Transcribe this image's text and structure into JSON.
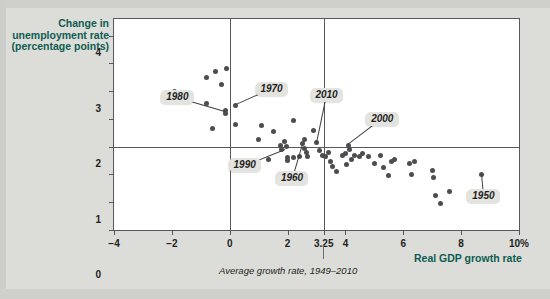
{
  "chart": {
    "type": "scatter",
    "y_axis_title": "Change in unemployment rate (percentage points)",
    "x_axis_title": "Real GDP growth rate",
    "average_caption": "Average growth rate, 1949–2010",
    "x_ticks": [
      "-4",
      "-2",
      "0",
      "2",
      "3.25",
      "4",
      "6",
      "8",
      "10%"
    ],
    "y_ticks": [
      "4",
      "3",
      "2",
      "1",
      "0",
      "-1",
      "-2",
      "-3"
    ],
    "average_growth_rate": "3.25",
    "colors": {
      "axis_title": "#0f5c52",
      "point": "#4d4d4f",
      "callout_bg": "#e3e3e0",
      "plot_bg": "#ffffff",
      "page_bg": "#dcdcd8"
    }
  },
  "chart_data": {
    "type": "scatter",
    "title": "",
    "xlabel": "Real GDP growth rate",
    "ylabel": "Change in unemployment rate (percentage points)",
    "xlim": [
      -4,
      10
    ],
    "ylim": [
      -3,
      4.6
    ],
    "xticks": [
      -4,
      -2,
      0,
      2,
      3.25,
      4,
      6,
      8,
      10
    ],
    "xticklabels": [
      "-4",
      "-2",
      "0",
      "2",
      "3.25",
      "4",
      "6",
      "8",
      "10%"
    ],
    "yticks": [
      4,
      3,
      2,
      1,
      0,
      -1,
      -2,
      -3
    ],
    "yticklabels": [
      "4",
      "3",
      "2",
      "1",
      "0",
      "-1",
      "-2",
      "-3"
    ],
    "grid": false,
    "legend": null,
    "reference_lines": [
      {
        "orientation": "vertical",
        "value": 0,
        "label": ""
      },
      {
        "orientation": "vertical",
        "value": 3.25,
        "label": "Average growth rate, 1949-2010"
      },
      {
        "orientation": "horizontal",
        "value": 0,
        "label": ""
      }
    ],
    "annotations": [
      {
        "label": "1980",
        "x": -0.15,
        "y": 1.3
      },
      {
        "label": "1970",
        "x": 0.2,
        "y": 1.5
      },
      {
        "label": "2010",
        "x": 3.0,
        "y": 0.15
      },
      {
        "label": "2000",
        "x": 4.1,
        "y": 0.05
      },
      {
        "label": "1990",
        "x": 1.9,
        "y": -0.1
      },
      {
        "label": "1960",
        "x": 2.5,
        "y": 0.1
      },
      {
        "label": "1950",
        "x": 8.7,
        "y": -1.0
      }
    ],
    "points": [
      {
        "x": -1.9,
        "y": 2.0
      },
      {
        "x": -0.8,
        "y": 2.5
      },
      {
        "x": -0.5,
        "y": 2.7
      },
      {
        "x": -0.3,
        "y": 2.25
      },
      {
        "x": -0.1,
        "y": 2.8
      },
      {
        "x": -0.8,
        "y": 1.55
      },
      {
        "x": -0.15,
        "y": 1.3
      },
      {
        "x": -0.15,
        "y": 1.2
      },
      {
        "x": -0.6,
        "y": 0.65
      },
      {
        "x": 0.2,
        "y": 1.5
      },
      {
        "x": 0.2,
        "y": 0.8
      },
      {
        "x": 1.1,
        "y": 0.75
      },
      {
        "x": 1.5,
        "y": 0.55
      },
      {
        "x": 1.0,
        "y": 0.25
      },
      {
        "x": 2.2,
        "y": 0.95
      },
      {
        "x": 2.9,
        "y": 0.6
      },
      {
        "x": 2.6,
        "y": 0.25
      },
      {
        "x": 3.0,
        "y": 0.15
      },
      {
        "x": 1.75,
        "y": 0.05
      },
      {
        "x": 1.9,
        "y": 0.2
      },
      {
        "x": 1.95,
        "y": 0.0
      },
      {
        "x": 2.0,
        "y": -0.5
      },
      {
        "x": 1.8,
        "y": -0.1
      },
      {
        "x": 1.35,
        "y": -0.45
      },
      {
        "x": 2.5,
        "y": 0.1
      },
      {
        "x": 2.6,
        "y": -0.05
      },
      {
        "x": 2.65,
        "y": -0.2
      },
      {
        "x": 2.7,
        "y": -0.35
      },
      {
        "x": 2.4,
        "y": -0.35
      },
      {
        "x": 2.2,
        "y": -0.4
      },
      {
        "x": 2.0,
        "y": -0.4
      },
      {
        "x": 3.2,
        "y": -0.3
      },
      {
        "x": 3.3,
        "y": -0.35
      },
      {
        "x": 3.4,
        "y": -0.2
      },
      {
        "x": 3.1,
        "y": -0.15
      },
      {
        "x": 3.5,
        "y": -0.55
      },
      {
        "x": 3.55,
        "y": -0.7
      },
      {
        "x": 3.9,
        "y": -0.3
      },
      {
        "x": 4.0,
        "y": -0.25
      },
      {
        "x": 4.1,
        "y": 0.05
      },
      {
        "x": 4.15,
        "y": -0.1
      },
      {
        "x": 4.2,
        "y": -0.45
      },
      {
        "x": 4.3,
        "y": -0.3
      },
      {
        "x": 4.05,
        "y": -0.65
      },
      {
        "x": 3.7,
        "y": -0.9
      },
      {
        "x": 4.5,
        "y": -0.35
      },
      {
        "x": 4.6,
        "y": -0.25
      },
      {
        "x": 4.8,
        "y": -0.35
      },
      {
        "x": 5.0,
        "y": -0.6
      },
      {
        "x": 5.2,
        "y": -0.3
      },
      {
        "x": 5.3,
        "y": -0.75
      },
      {
        "x": 5.6,
        "y": -0.55
      },
      {
        "x": 5.7,
        "y": -0.45
      },
      {
        "x": 5.5,
        "y": -1.05
      },
      {
        "x": 6.2,
        "y": -0.6
      },
      {
        "x": 6.4,
        "y": -0.55
      },
      {
        "x": 6.3,
        "y": -1.0
      },
      {
        "x": 7.0,
        "y": -0.85
      },
      {
        "x": 7.05,
        "y": -1.1
      },
      {
        "x": 7.1,
        "y": -1.75
      },
      {
        "x": 7.6,
        "y": -1.6
      },
      {
        "x": 7.3,
        "y": -2.05
      },
      {
        "x": 8.7,
        "y": -1.0
      }
    ]
  }
}
